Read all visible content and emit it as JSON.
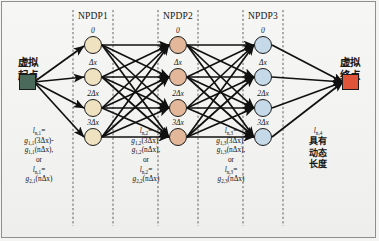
{
  "figure": {
    "background": "#f2f2f0",
    "border_color": "#8f8f8f"
  },
  "terminals": {
    "start": {
      "label_line1": "虚拟",
      "label_line2": "起点",
      "color": "#4a6b5c",
      "shape": "square"
    },
    "end": {
      "label_line1": "虚拟",
      "label_line2": "终点",
      "color": "#e0543a",
      "shape": "square"
    }
  },
  "layers": [
    {
      "header": "NPDP1",
      "node_color": "#efe2c0",
      "nodes": [
        {
          "label": "0"
        },
        {
          "label": "Δx"
        },
        {
          "label": "2Δx"
        },
        {
          "label": "3Δx"
        }
      ],
      "formula": {
        "l1": "l",
        "l1_sub": "n,1",
        "eq": "=",
        "line2": "g",
        "line2_sub": "1,1",
        "line2_rest": "(3Δx)-",
        "line3": "g",
        "line3_sub": "1,1",
        "line3_rest": "(nΔx),",
        "or": "or",
        "l2": "l",
        "l2_sub": "n,1",
        "line6": "g",
        "line6_sub": "2,1",
        "line6_rest": "(nΔx)"
      }
    },
    {
      "header": "NPDP2",
      "node_color": "#e3b89a",
      "nodes": [
        {
          "label": "0"
        },
        {
          "label": "Δx"
        },
        {
          "label": "2Δx"
        },
        {
          "label": "3Δx"
        }
      ],
      "formula": {
        "l1": "l",
        "l1_sub": "n,2",
        "eq": "=",
        "line2": "g",
        "line2_sub": "1,2",
        "line2_rest": "(3Δx)-",
        "line3": "g",
        "line3_sub": "1,2",
        "line3_rest": "(nΔx),",
        "or": "or",
        "l2": "l",
        "l2_sub": "n,2",
        "line6": "g",
        "line6_sub": "2,2",
        "line6_rest": "(nΔx)"
      }
    },
    {
      "header": "NPDP3",
      "node_color": "#c5d9e8",
      "nodes": [
        {
          "label": "0"
        },
        {
          "label": "Δx"
        },
        {
          "label": "2Δx"
        },
        {
          "label": "3Δx"
        }
      ],
      "formula": {
        "l1": "l",
        "l1_sub": "n,3",
        "eq": "=",
        "line2": "g",
        "line2_sub": "1,3",
        "line2_rest": "(3Δx)-",
        "line3": "g",
        "line3_sub": "1,3",
        "line3_rest": "(nΔx),",
        "or": "or",
        "l2": "l",
        "l2_sub": "n,3",
        "line6": "g",
        "line6_sub": "2,3",
        "line6_rest": "(nΔx)"
      }
    }
  ],
  "last_note": {
    "l": "l",
    "l_sub": "n,4",
    "line1": "具有",
    "line2": "动态",
    "line3": "长度"
  }
}
